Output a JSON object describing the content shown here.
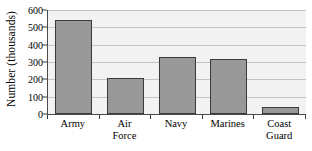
{
  "chart_data": {
    "type": "bar",
    "title": "",
    "subtitle": "",
    "xlabel": "",
    "ylabel": "Number (thousands)",
    "categories": [
      "Army",
      "Air Force",
      "Navy",
      "Marines",
      "Coast Guard"
    ],
    "category_lines": [
      [
        "Army"
      ],
      [
        "Air",
        "Force"
      ],
      [
        "Navy"
      ],
      [
        "Marines"
      ],
      [
        "Coast",
        "Guard"
      ]
    ],
    "values": [
      545,
      205,
      330,
      320,
      38
    ],
    "ylim": [
      0,
      600
    ],
    "yticks": [
      0,
      100,
      200,
      300,
      400,
      500,
      600
    ],
    "ytick_labels": [
      "0",
      "100",
      "200",
      "300",
      "400",
      "500",
      "600"
    ],
    "grid": true,
    "legend": false,
    "legend_position": "none",
    "colors": {
      "bar_fill": "#989898",
      "bar_edge": "#3a3a3a",
      "plot_background": "#f2f2f2",
      "gridline": "#c4c4c4",
      "axis": "#4a4a4a",
      "text": "#000000",
      "figure_background": "#ffffff"
    }
  }
}
